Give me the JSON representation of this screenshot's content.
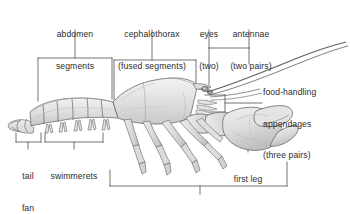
{
  "diagram": {
    "style": {
      "background": "#ffffff",
      "line_color": "#4a4a4a",
      "text_color": "#2b2b2b",
      "body_fill_light": "#e8e8e8",
      "body_fill_mid": "#d5d5d5",
      "body_fill_dark": "#bdbdbd",
      "outline_color": "#555555"
    },
    "labels": {
      "abdomen_segments": "abdomen\nsegments",
      "cephalothorax": "cephalothorax\n(fused segments)",
      "eyes": "eyes\n(two)",
      "antennae": "antennae\n(two pairs)",
      "food_handling": "food-handling\nappendages\n(three pairs)",
      "first_leg": "first leg",
      "tail_fan": "tail\nfan",
      "swimmerets": "swimmerets",
      "walking_legs": "walking legs (five pairs)"
    },
    "label_lines": {
      "abdomen_segments": [
        "abdomen",
        "segments"
      ],
      "cephalothorax": [
        "cephalothorax",
        "(fused segments)"
      ],
      "eyes": [
        "eyes",
        "(two)"
      ],
      "antennae": [
        "antennae",
        "(two pairs)"
      ],
      "food_handling": [
        "food-handling",
        "appendages",
        "(three pairs)"
      ],
      "first_leg": [
        "first leg"
      ],
      "tail_fan": [
        "tail",
        "fan"
      ],
      "swimmerets": [
        "swimmerets"
      ],
      "walking_legs": [
        "walking legs (five pairs)"
      ]
    },
    "parts": [
      {
        "name": "abdomen segments",
        "count": 6,
        "region": "posterior"
      },
      {
        "name": "cephalothorax (fused segments)",
        "count": 1,
        "region": "anterior"
      },
      {
        "name": "eyes",
        "count": "two"
      },
      {
        "name": "antennae",
        "count": "two pairs"
      },
      {
        "name": "food-handling appendages",
        "count": "three pairs"
      },
      {
        "name": "first leg",
        "count": "one pair (chelipeds)"
      },
      {
        "name": "tail fan",
        "count": 1
      },
      {
        "name": "swimmerets",
        "count": 5
      },
      {
        "name": "walking legs",
        "count": "five pairs"
      }
    ]
  }
}
